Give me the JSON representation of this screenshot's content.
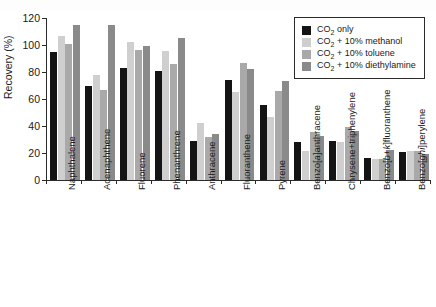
{
  "chart_data": {
    "type": "bar",
    "title": "",
    "xlabel": "",
    "ylabel": "Recovery (%)",
    "ylim": [
      0,
      120
    ],
    "yticks": [
      0,
      20,
      40,
      60,
      80,
      100,
      120
    ],
    "grid": false,
    "legend_position": "top-right",
    "categories": [
      "Naphthalene",
      "Acenaphthene",
      "Fluorene",
      "Phenanthrene",
      "Anthracene",
      "Fluoranthene",
      "Pyrene",
      "Benzo[a]anthracene",
      "Chrysene+triphenylene",
      "Benzo[b+k]fluoranthene",
      "Benzo[ghi]perylene"
    ],
    "series": [
      {
        "name": "CO2 only",
        "label_html": "CO<sub>2</sub> only",
        "color": "#141414",
        "values": [
          95,
          69.5,
          83,
          81,
          29,
          74,
          55.5,
          28,
          29,
          16.5,
          20.5
        ]
      },
      {
        "name": "CO2 + 10% methanol",
        "label_html": "CO<sub>2</sub> + 10% methanol",
        "color": "#cfcfcf",
        "values": [
          106.5,
          77.5,
          102.5,
          95.5,
          42,
          65.5,
          46.5,
          21.5,
          28,
          15.5,
          21.5
        ]
      },
      {
        "name": "CO2 + 10% toluene",
        "label_html": "CO<sub>2</sub> + 10% toluene",
        "color": "#a9a9a9",
        "values": [
          101,
          67,
          96,
          86,
          32,
          86.5,
          66,
          35.5,
          39.5,
          15.5,
          21.5
        ]
      },
      {
        "name": "CO2 + 10% diethylamine",
        "label_html": "CO<sub>2</sub> + 10% diethylamine",
        "color": "#8a8a8a",
        "values": [
          115,
          114.5,
          99,
          105.5,
          34,
          82.5,
          73.5,
          32.5,
          36.5,
          22.5,
          19
        ]
      }
    ]
  },
  "axis": {
    "y_label": "Recovery (%)"
  }
}
